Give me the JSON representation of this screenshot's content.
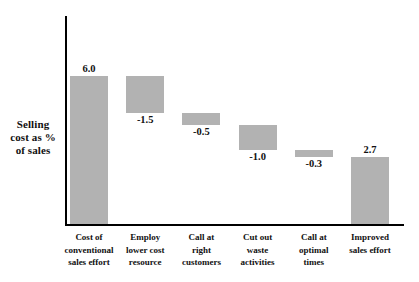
{
  "chart_data": {
    "type": "bar",
    "chart_subtype": "waterfall",
    "title": "",
    "xlabel": "",
    "ylabel": "Selling cost as % of sales",
    "ylabel_lines": [
      "Selling",
      "cost as %",
      "of sales"
    ],
    "categories": [
      "Cost of conventional sales effort",
      "Employ lower cost resource",
      "Call at right customers",
      "Cut out waste activities",
      "Call at optimal times",
      "Improved sales effort"
    ],
    "category_lines": [
      [
        "Cost of",
        "conventional",
        "sales effort"
      ],
      [
        "Employ",
        "lower cost",
        "resource"
      ],
      [
        "Call at",
        "right",
        "customers"
      ],
      [
        "Cut out",
        "waste",
        "activities"
      ],
      [
        "Call at",
        "optimal",
        "times"
      ],
      [
        "Improved",
        "sales effort"
      ]
    ],
    "values": [
      6.0,
      -1.5,
      -0.5,
      -1.0,
      -0.3,
      2.7
    ],
    "value_labels": [
      "6.0",
      "-1.5",
      "-0.5",
      "-1.0",
      "-0.3",
      "2.7"
    ],
    "label_positions": [
      "above",
      "below",
      "below",
      "below",
      "below",
      "above"
    ],
    "bar_types": [
      "total",
      "delta",
      "delta",
      "delta",
      "delta",
      "total"
    ],
    "cumulative_start": [
      0.0,
      6.0,
      4.5,
      4.0,
      3.0,
      0.0
    ],
    "cumulative_end": [
      6.0,
      4.5,
      4.0,
      3.0,
      2.7,
      2.7
    ],
    "ylim": [
      0,
      8.5
    ],
    "grid": false,
    "legend": false,
    "legend_position": "none",
    "bar_color": "#b2b2b2",
    "axis_color": "#000000",
    "text_color": "#111111",
    "background_color": "#ffffff"
  }
}
